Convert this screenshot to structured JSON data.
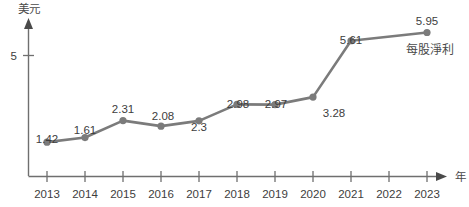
{
  "chart_data": {
    "type": "line",
    "title": "",
    "subtitle": "",
    "xlabel": "年",
    "ylabel": "美元",
    "categories": [
      "2013",
      "2014",
      "2015",
      "2016",
      "2017",
      "2018",
      "2019",
      "2020",
      "2021",
      "2022",
      "2023"
    ],
    "values": [
      1.42,
      1.61,
      2.31,
      2.08,
      2.3,
      2.98,
      2.97,
      3.28,
      5.61,
      null,
      5.95
    ],
    "point_labels": [
      "1.42",
      "1.61",
      "2.31",
      "2.08",
      "2.3",
      "2.98",
      "2.97",
      "3.28",
      "5.61",
      "",
      "5.95"
    ],
    "series": [
      {
        "name": "每股淨利",
        "values": [
          1.42,
          1.61,
          2.31,
          2.08,
          2.3,
          2.98,
          2.97,
          3.28,
          5.61,
          null,
          5.95
        ],
        "color": "#7b7b7b"
      }
    ],
    "legend": {
      "position": "inline-right",
      "entries": [
        "每股淨利"
      ]
    },
    "y_axis": {
      "tick_labels": [
        "5"
      ],
      "tick_values": [
        5
      ],
      "ylim": [
        0,
        7.2
      ],
      "grid": false,
      "arrow": true
    },
    "x_axis": {
      "tick_labels": [
        "2013",
        "2014",
        "2015",
        "2016",
        "2017",
        "2018",
        "2019",
        "2020",
        "2021",
        "2022",
        "2023"
      ],
      "grid": false,
      "arrow": true
    },
    "colors": {
      "line": "#7b7b7b",
      "marker": "#7b7b7b",
      "axis": "#6f6f6f",
      "text": "#3d3d3d",
      "background": "#ffffff"
    }
  },
  "axis_titles": {
    "y": "美元",
    "x": "年"
  },
  "series_label": {
    "text": "每股淨利"
  },
  "y_tick": {
    "label_5": "5"
  },
  "value_labels": {
    "v2013": "1.42",
    "v2014": "1.61",
    "v2015": "2.31",
    "v2016": "2.08",
    "v2017": "2.3",
    "v2018": "2.98",
    "v2019": "2.97",
    "v2020": "3.28",
    "v2021": "5.61",
    "v2023": "5.95"
  },
  "x_tick_labels": {
    "t2013": "2013",
    "t2014": "2014",
    "t2015": "2015",
    "t2016": "2016",
    "t2017": "2017",
    "t2018": "2018",
    "t2019": "2019",
    "t2020": "2020",
    "t2021": "2021",
    "t2022": "2022",
    "t2023": "2023"
  }
}
